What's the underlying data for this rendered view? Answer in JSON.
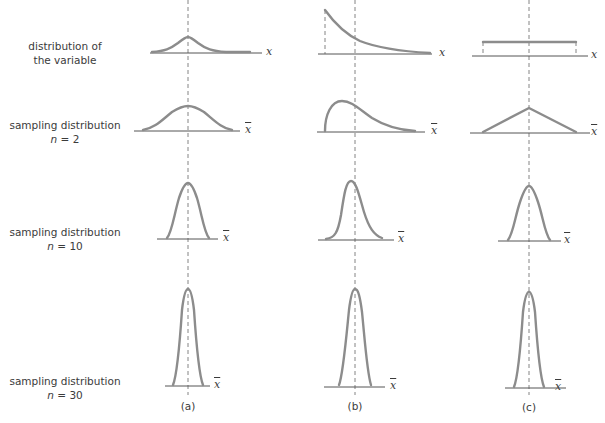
{
  "figure": {
    "rows": [
      {
        "id": "variable",
        "line1": "distribution of",
        "line2": "the variable",
        "axis": "x"
      },
      {
        "id": "n2",
        "line1": "sampling distribution",
        "n_prefix": "n",
        "n_text": " = 2",
        "axis": "x̄"
      },
      {
        "id": "n10",
        "line1": "sampling distribution",
        "n_prefix": "n",
        "n_text": " = 10",
        "axis": "x̄"
      },
      {
        "id": "n30",
        "line1": "sampling distribution",
        "n_prefix": "n",
        "n_text": " = 30",
        "axis": "x̄"
      }
    ],
    "columns": [
      {
        "id": "a",
        "label": "(a)",
        "shape": "normal"
      },
      {
        "id": "b",
        "label": "(b)",
        "shape": "exponential / right-skewed"
      },
      {
        "id": "c",
        "label": "(c)",
        "shape": "uniform"
      }
    ],
    "axis_symbols": {
      "x": "x",
      "xbar": "x"
    },
    "colors": {
      "curve": "#8c8c8c",
      "axis": "#555555",
      "text": "#3b3b3b",
      "background": "#ffffff"
    }
  }
}
